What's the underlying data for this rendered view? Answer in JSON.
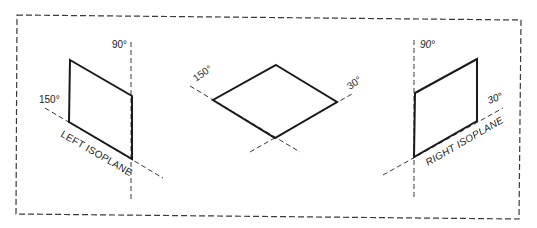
{
  "figure": {
    "type": "isometric-isoplanes",
    "colors": {
      "line": "#1a1a1a",
      "dashed": "#3a3a3a",
      "background": "#ffffff"
    }
  },
  "left_isoplane": {
    "label": "LEFT ISOPLANE",
    "angle_vertical": "90°",
    "angle_oblique": "150°"
  },
  "top_isoplane": {
    "angle_left": "150°",
    "angle_right": "30°"
  },
  "right_isoplane": {
    "label": "RIGHT ISOPLANE",
    "angle_vertical": "90°",
    "angle_oblique": "30°"
  }
}
